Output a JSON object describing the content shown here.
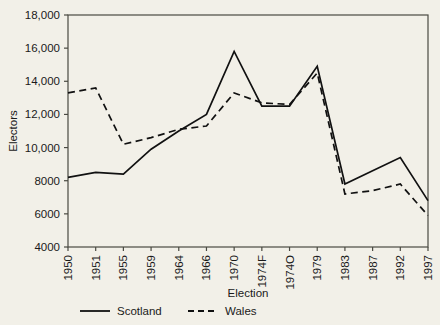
{
  "chart_data": {
    "type": "line",
    "title": "",
    "xlabel": "Election",
    "ylabel": "Electors",
    "categories": [
      "1950",
      "1951",
      "1955",
      "1959",
      "1964",
      "1966",
      "1970",
      "1974F",
      "1974O",
      "1979",
      "1983",
      "1987",
      "1992",
      "1997"
    ],
    "ylim": [
      4000,
      18000
    ],
    "ytick_labels": [
      "18,000",
      "16,000",
      "14,000",
      "12,000",
      "10,000",
      "8000",
      "6000",
      "4000"
    ],
    "ytick_values": [
      18000,
      16000,
      14000,
      12000,
      10000,
      8000,
      6000,
      4000
    ],
    "grid": false,
    "legend_position": "bottom",
    "series": [
      {
        "name": "Scotland",
        "style": "solid",
        "color": "#111111",
        "values": [
          8200,
          8500,
          8400,
          9900,
          11000,
          12000,
          15800,
          12500,
          12500,
          14900,
          7800,
          8600,
          9400,
          6800
        ]
      },
      {
        "name": "Wales",
        "style": "dashed",
        "color": "#111111",
        "values": [
          13300,
          13600,
          10200,
          10600,
          11100,
          11300,
          13300,
          12700,
          12600,
          14500,
          7200,
          7400,
          7800,
          5900
        ]
      }
    ]
  },
  "legend": {
    "items": [
      {
        "label": "Scotland",
        "style": "solid"
      },
      {
        "label": "Wales",
        "style": "dashed"
      }
    ]
  }
}
